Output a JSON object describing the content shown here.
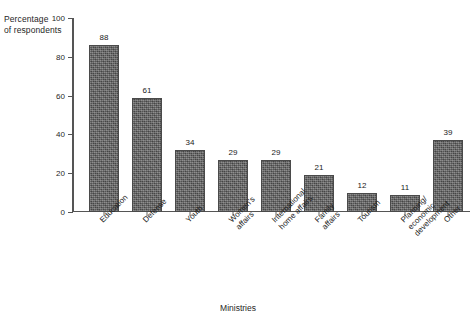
{
  "chart_data": {
    "type": "bar",
    "title": "",
    "xlabel": "Ministries",
    "ylabel": "Percentage\nof respondents",
    "ylim": [
      0,
      100
    ],
    "yticks": [
      0,
      20,
      40,
      60,
      80,
      100
    ],
    "grid": false,
    "legend": false,
    "categories": [
      "Education",
      "Defense",
      "Youth",
      "Women's affairs",
      "International\nhome affairs",
      "Family affairs",
      "Tourism",
      "Planning/\neconomic development",
      "Other"
    ],
    "values": [
      88,
      61,
      34,
      29,
      29,
      21,
      12,
      11,
      39
    ],
    "value_labels": [
      "88",
      "61",
      "34",
      "29",
      "29",
      "21",
      "12",
      "11",
      "39"
    ],
    "bar_heights_plotted": [
      86,
      59,
      32,
      27,
      27,
      19,
      10,
      9,
      37
    ],
    "colors": {
      "bar_fill": "#5b5b5b",
      "bar_edge": "#4a4a4a",
      "axis": "#555555",
      "text": "#1a1a1a",
      "background": "#ffffff"
    }
  }
}
